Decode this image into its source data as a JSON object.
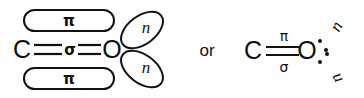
{
  "figure": {
    "kind": "molecular-orbital-diagram",
    "background_color": "#fefefe",
    "ink_color": "#111111",
    "connector_text": "or"
  },
  "left_structure": {
    "name": "orbital-lobe-representation",
    "atoms": [
      {
        "id": "carbon",
        "label": "C",
        "x": 22,
        "y": 49
      },
      {
        "id": "oxygen",
        "label": "O",
        "x": 112,
        "y": 49
      }
    ],
    "bond": {
      "type": "double-line-with-center-label",
      "center_label": "σ",
      "center_label_name": "sigma"
    },
    "pi_orbitals": [
      {
        "id": "pi-top",
        "label": "π",
        "position": "above"
      },
      {
        "id": "pi-bottom",
        "label": "π",
        "position": "below"
      }
    ],
    "lone_pair_lobes": [
      {
        "id": "n-lobe-upper",
        "label": "n",
        "direction": "upper-right"
      },
      {
        "id": "n-lobe-lower",
        "label": "n",
        "direction": "lower-right"
      }
    ]
  },
  "right_structure": {
    "name": "compact-lewis-representation",
    "atoms": [
      {
        "id": "carbon",
        "label": "C",
        "x": 253,
        "y": 50
      },
      {
        "id": "oxygen",
        "label": "O",
        "x": 305,
        "y": 50
      }
    ],
    "bond": {
      "type": "double-line",
      "top_label": "π",
      "top_label_name": "pi",
      "bottom_label": "σ",
      "bottom_label_name": "sigma"
    },
    "lone_pairs": [
      {
        "id": "n-pair-upper",
        "label": "n",
        "direction": "upper-right",
        "dot_count": 2
      },
      {
        "id": "n-pair-lower",
        "label": "n",
        "direction": "lower-right",
        "dot_count": 2
      }
    ]
  }
}
